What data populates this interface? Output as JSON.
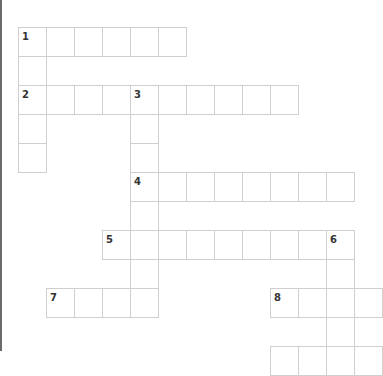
{
  "puzzle": {
    "cell_width": 28,
    "cell_height": 29,
    "origin_x": 18,
    "origin_y": 27,
    "colors": {
      "grid_line": "#cfcfcf",
      "number": "#333333",
      "left_bar": "#6b6b6b",
      "background": "#ffffff"
    },
    "entries": [
      {
        "number": "1",
        "direction": "across",
        "col": 0,
        "row": 0,
        "length": 6
      },
      {
        "number": "1",
        "direction": "down",
        "col": 0,
        "row": 0,
        "length": 5
      },
      {
        "number": "2",
        "direction": "across",
        "col": 0,
        "row": 2,
        "length": 10
      },
      {
        "number": "3",
        "direction": "down",
        "col": 4,
        "row": 2,
        "length": 8
      },
      {
        "number": "4",
        "direction": "across",
        "col": 4,
        "row": 5,
        "length": 8
      },
      {
        "number": "5",
        "direction": "across",
        "col": 3,
        "row": 7,
        "length": 9
      },
      {
        "number": "6",
        "direction": "down",
        "col": 11,
        "row": 7,
        "length": 5
      },
      {
        "number": "7",
        "direction": "across",
        "col": 1,
        "row": 9,
        "length": 4
      },
      {
        "number": "8",
        "direction": "across",
        "col": 9,
        "row": 9,
        "length": 4
      },
      {
        "number": "",
        "direction": "across",
        "col": 9,
        "row": 11,
        "length": 4
      }
    ]
  }
}
